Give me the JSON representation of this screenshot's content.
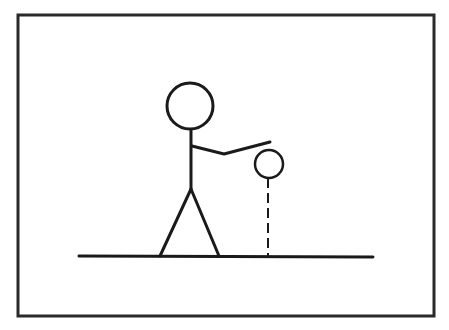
{
  "diagram": {
    "type": "line-drawing",
    "colors": {
      "background": "#ffffff",
      "stroke": "#1a1a1a",
      "frame": "#2a2a2a"
    },
    "frame": {
      "x": 18,
      "y": 15,
      "width": 416,
      "height": 301,
      "stroke_width": 3
    },
    "ground": {
      "x1": 79,
      "y1": 256,
      "x2": 373,
      "y2": 257,
      "stroke_width": 3
    },
    "figure": {
      "head": {
        "cx": 190,
        "cy": 106,
        "r": 23
      },
      "body": {
        "x1": 191,
        "y1": 129,
        "x2": 191,
        "y2": 189
      },
      "arm": {
        "points": "192,146 224,154 270,142"
      },
      "left_leg": {
        "x1": 191,
        "y1": 189,
        "x2": 160,
        "y2": 256
      },
      "right_leg": {
        "x1": 191,
        "y1": 189,
        "x2": 219,
        "y2": 256
      }
    },
    "ball": {
      "cx": 269,
      "cy": 164,
      "r": 14
    },
    "drop_line": {
      "x": 268,
      "y1": 178,
      "y2": 256,
      "dash": "10 5",
      "style": "dashed"
    },
    "caption": ""
  }
}
